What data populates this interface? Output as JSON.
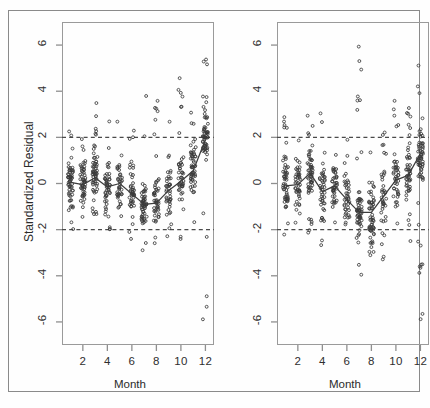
{
  "figure": {
    "background": "#fefefe",
    "border_color": "#8a8a8a",
    "point_color": "#3a3a3a",
    "line_color": "#3c3c3c",
    "refline_color": "#4a4a4a"
  },
  "chart_data": [
    {
      "type": "scatter",
      "panel": "left",
      "title": "",
      "xlabel": "Month",
      "ylabel": "Standardized Residual",
      "xlim": [
        0.3,
        12.7
      ],
      "ylim": [
        -7.0,
        7.0
      ],
      "xticks": [
        2,
        4,
        6,
        8,
        10,
        12
      ],
      "xticklabels": [
        "2",
        "4",
        "6",
        "8",
        "10",
        "12"
      ],
      "yticks": [
        -6,
        -4,
        -2,
        0,
        2,
        4,
        6
      ],
      "yticklabels": [
        "-6",
        "-4",
        "-2",
        "0",
        "2",
        "4",
        "6"
      ],
      "grid": false,
      "legend": null,
      "reference_lines": [
        {
          "orientation": "horizontal",
          "y": 2,
          "style": "dashed"
        },
        {
          "orientation": "horizontal",
          "y": -2,
          "style": "dashed"
        }
      ],
      "series": [
        {
          "name": "median-trace",
          "type": "line",
          "x": [
            1,
            2,
            3,
            4,
            5,
            6,
            7,
            8,
            9,
            10,
            11,
            12
          ],
          "values": [
            0.05,
            -0.05,
            0.25,
            -0.15,
            0.0,
            -0.45,
            -0.9,
            -0.85,
            -0.3,
            0.1,
            0.55,
            1.9
          ]
        },
        {
          "name": "standardized-residuals",
          "type": "scatter",
          "months": [
            1,
            2,
            3,
            4,
            5,
            6,
            7,
            8,
            9,
            10,
            11,
            12
          ],
          "counts_per_month": [
            58,
            52,
            60,
            48,
            40,
            44,
            54,
            50,
            42,
            46,
            52,
            64
          ],
          "y_spread": {
            "1": [
              -2.2,
              2.6
            ],
            "2": [
              -2.4,
              2.3
            ],
            "3": [
              -2.3,
              3.7
            ],
            "4": [
              -2.1,
              4.0
            ],
            "5": [
              -1.9,
              3.9
            ],
            "6": [
              -3.1,
              2.3
            ],
            "7": [
              -3.1,
              4.9
            ],
            "8": [
              -3.1,
              3.6
            ],
            "9": [
              -2.6,
              2.9
            ],
            "10": [
              -2.9,
              4.6
            ],
            "11": [
              -2.4,
              3.3
            ],
            "12": [
              -6.3,
              5.6
            ]
          }
        }
      ]
    },
    {
      "type": "scatter",
      "panel": "right",
      "title": "",
      "xlabel": "Month",
      "ylabel": "",
      "xlim": [
        0.3,
        12.7
      ],
      "ylim": [
        -7.0,
        7.0
      ],
      "xticks": [
        2,
        4,
        6,
        8,
        10,
        12
      ],
      "xticklabels": [
        "2",
        "4",
        "6",
        "8",
        "10",
        "12"
      ],
      "yticks": [
        -6,
        -4,
        -2,
        0,
        2,
        4,
        6
      ],
      "yticklabels": [
        "-6",
        "-4",
        "-2",
        "0",
        "2",
        "4",
        "6"
      ],
      "grid": false,
      "legend": null,
      "reference_lines": [
        {
          "orientation": "horizontal",
          "y": 2,
          "style": "dashed"
        },
        {
          "orientation": "horizontal",
          "y": -2,
          "style": "dashed"
        }
      ],
      "series": [
        {
          "name": "median-trace",
          "type": "line",
          "x": [
            1,
            2,
            3,
            4,
            5,
            6,
            7,
            8,
            9,
            10,
            11,
            12
          ],
          "values": [
            -0.1,
            -0.05,
            0.45,
            -0.35,
            -0.1,
            -0.7,
            -1.25,
            -1.25,
            -0.55,
            0.15,
            0.35,
            1.3
          ]
        },
        {
          "name": "standardized-residuals",
          "type": "scatter",
          "months": [
            1,
            2,
            3,
            4,
            5,
            6,
            7,
            8,
            9,
            10,
            11,
            12
          ],
          "counts_per_month": [
            56,
            46,
            58,
            44,
            42,
            40,
            60,
            56,
            40,
            44,
            50,
            66
          ],
          "y_spread": {
            "1": [
              -2.3,
              3.0
            ],
            "2": [
              -2.2,
              2.9
            ],
            "3": [
              -2.4,
              3.4
            ],
            "4": [
              -3.2,
              3.5
            ],
            "5": [
              -2.3,
              2.2
            ],
            "6": [
              -2.2,
              2.3
            ],
            "7": [
              -4.0,
              6.1
            ],
            "8": [
              -3.5,
              3.6
            ],
            "9": [
              -3.3,
              4.1
            ],
            "10": [
              -3.3,
              3.6
            ],
            "11": [
              -2.5,
              3.3
            ],
            "12": [
              -6.0,
              6.0
            ]
          }
        }
      ]
    }
  ],
  "panels": {
    "left": {
      "y_axis_title": "Standardized Residual",
      "x_axis_title": "Month",
      "y_tick_labels": [
        "6",
        "4",
        "2",
        "0",
        "-2",
        "-4",
        "-6"
      ],
      "x_tick_labels": [
        "2",
        "4",
        "6",
        "8",
        "10",
        "12"
      ]
    },
    "right": {
      "y_axis_title": "",
      "x_axis_title": "Month",
      "y_tick_labels": [
        "6",
        "4",
        "2",
        "0",
        "-2",
        "-4",
        "-6"
      ],
      "x_tick_labels": [
        "2",
        "4",
        "6",
        "8",
        "10",
        "12"
      ]
    }
  },
  "caption_fragment": ""
}
